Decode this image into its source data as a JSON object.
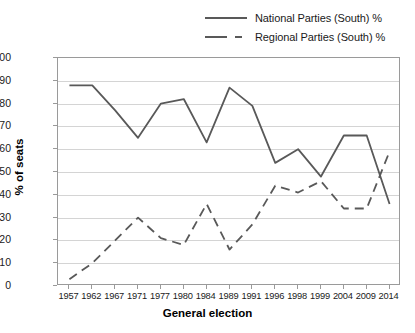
{
  "chart_data": {
    "type": "line",
    "title": "",
    "xlabel": "General election",
    "ylabel": "% of seats",
    "categories": [
      "1957",
      "1962",
      "1967",
      "1971",
      "1977",
      "1980",
      "1984",
      "1989",
      "1991",
      "1996",
      "1998",
      "1999",
      "2004",
      "2009",
      "2014"
    ],
    "ylim": [
      0,
      100
    ],
    "ytick_step": 10,
    "yticks": [
      "0",
      "10",
      "20",
      "30",
      "40",
      "50",
      "60",
      "70",
      "80",
      "90",
      "100"
    ],
    "grid": true,
    "legend_position": "top-right",
    "series": [
      {
        "name": "National Parties (South) %",
        "style": "solid",
        "color": "#595959",
        "values": [
          88,
          88,
          77,
          65,
          80,
          82,
          63,
          87,
          79,
          54,
          60,
          48,
          66,
          66,
          36
        ]
      },
      {
        "name": "Regional Parties (South) %",
        "style": "dashed",
        "color": "#595959",
        "values": [
          3,
          10,
          20,
          30,
          21,
          18,
          36,
          16,
          27,
          44,
          41,
          46,
          34,
          34,
          59
        ]
      }
    ]
  }
}
